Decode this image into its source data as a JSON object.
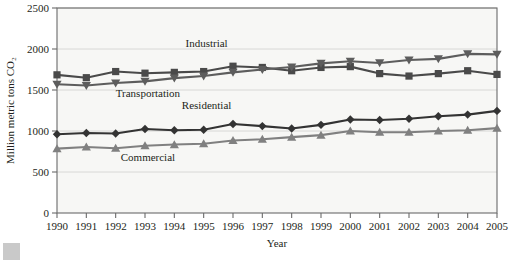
{
  "chart_data": {
    "type": "line",
    "title": "",
    "xlabel": "Year",
    "ylabel": "Million metric tons CO₂",
    "categories": [
      1990,
      1991,
      1992,
      1993,
      1994,
      1995,
      1996,
      1997,
      1998,
      1999,
      2000,
      2001,
      2002,
      2003,
      2004,
      2005
    ],
    "xlim": [
      1990,
      2005
    ],
    "ylim": [
      0,
      2500
    ],
    "yticks": [
      0,
      500,
      1000,
      1500,
      2000,
      2500
    ],
    "ytick_labels": [
      "0",
      "500",
      "1000",
      "1500",
      "2000",
      "2500"
    ],
    "xtick_labels": [
      "1990",
      "1991",
      "1992",
      "1993",
      "1994",
      "1995",
      "1996",
      "1997",
      "1998",
      "1999",
      "2000",
      "2001",
      "2002",
      "2003",
      "2004",
      "2005"
    ],
    "grid": true,
    "legend_position": "inline-annotations",
    "series": [
      {
        "name": "Industrial",
        "marker": "square",
        "color": "#4a4a4a",
        "values": [
          1685,
          1650,
          1725,
          1705,
          1715,
          1725,
          1790,
          1775,
          1735,
          1775,
          1785,
          1700,
          1670,
          1700,
          1735,
          1690
        ]
      },
      {
        "name": "Transportation",
        "marker": "triangle-down",
        "color": "#5d5d5d",
        "values": [
          1570,
          1555,
          1585,
          1605,
          1645,
          1670,
          1715,
          1750,
          1780,
          1825,
          1850,
          1830,
          1865,
          1880,
          1940,
          1935
        ]
      },
      {
        "name": "Residential",
        "marker": "diamond",
        "color": "#333333",
        "values": [
          960,
          975,
          970,
          1025,
          1010,
          1015,
          1085,
          1060,
          1030,
          1075,
          1140,
          1135,
          1150,
          1180,
          1200,
          1245
        ]
      },
      {
        "name": "Commercial",
        "marker": "triangle-up",
        "color": "#808080",
        "values": [
          785,
          805,
          790,
          820,
          835,
          845,
          885,
          900,
          925,
          950,
          1000,
          985,
          985,
          1000,
          1010,
          1035
        ]
      }
    ],
    "annotations": [
      {
        "text": "Industrial",
        "x": 1995.1,
        "y": 2030
      },
      {
        "text": "Transportation",
        "x": 1993.1,
        "y": 1415
      },
      {
        "text": "Residential",
        "x": 1995.1,
        "y": 1270
      },
      {
        "text": "Commercial",
        "x": 1993.1,
        "y": 640
      }
    ],
    "colors": {
      "industrial": "#4a4a4a",
      "transportation": "#5d5d5d",
      "residential": "#333333",
      "commercial": "#808080",
      "plot_background": "#f7f7f5",
      "axis": "#6b6b6b",
      "grid": "#d8d8d6"
    }
  }
}
